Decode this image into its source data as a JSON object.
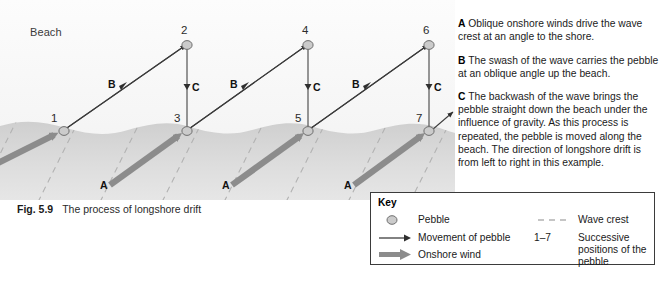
{
  "figure": {
    "number": "Fig. 5.9",
    "caption": "The process of longshore drift"
  },
  "diagram": {
    "beach_label": "Beach",
    "pebble_numbers": [
      "1",
      "2",
      "3",
      "4",
      "5",
      "6",
      "7"
    ],
    "swash_label": "B",
    "backwash_label": "C",
    "wind_label": "A",
    "colors": {
      "sea": "#d9d9d9",
      "beach": "#f7f7f7",
      "wind_arrow": "#8c8c8c",
      "wave_crest": "#b4b4b4",
      "pebble_fill": "#c9c9c9",
      "pebble_stroke": "#6f6f6f",
      "movement_line": "#3b3b3b"
    }
  },
  "explanation": [
    {
      "tag": "A",
      "text": "Oblique onshore winds drive the wave crest at an angle to the shore."
    },
    {
      "tag": "B",
      "text": "The swash of the wave carries the pebble at an oblique angle up the beach."
    },
    {
      "tag": "C",
      "text": "The backwash of the wave brings the pebble straight down the beach under the influence of gravity. As this process is repeated, the pebble is moved along the beach. The direction of longshore drift is from left to right in this example."
    }
  ],
  "key": {
    "title": "Key",
    "items": [
      {
        "symbol": "pebble-circle",
        "label": "Pebble"
      },
      {
        "symbol": "thin-arrow",
        "label": "Movement of pebble"
      },
      {
        "symbol": "thick-arrow",
        "label": "Onshore wind"
      },
      {
        "symbol": "dashed-line",
        "label": "Wave crest"
      },
      {
        "symbol": "range-1-7",
        "label": "Successive positions of the pebble",
        "range": "1–7"
      }
    ]
  }
}
